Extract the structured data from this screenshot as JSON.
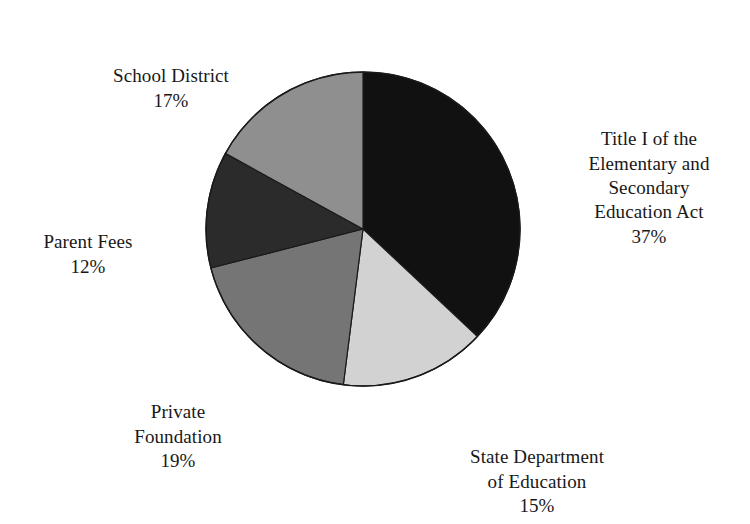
{
  "chart_data": {
    "type": "pie",
    "title": "",
    "subtitle": "",
    "xlabel": "",
    "ylabel": "",
    "legend_position": "none",
    "grid": false,
    "labels_show_percent": true,
    "start_angle_deg": 0,
    "direction": "clockwise",
    "categories": [
      "Title I of the Elementary and Secondary Education Act",
      "State Department of Education",
      "Private Foundation",
      "Parent Fees",
      "School District"
    ],
    "values": [
      37,
      15,
      19,
      12,
      17
    ],
    "units": "%",
    "slices": [
      {
        "name": "title-i",
        "label_lines": "Title I of the\nElementary and\nSecondary\nEducation Act",
        "percent_text": "37%",
        "value": 37,
        "color": "#111111"
      },
      {
        "name": "state-department-of-education",
        "label_lines": "State Department\nof Education",
        "percent_text": "15%",
        "value": 15,
        "color": "#d2d2d2"
      },
      {
        "name": "private-foundation",
        "label_lines": "Private\nFoundation",
        "percent_text": "19%",
        "value": 19,
        "color": "#757575"
      },
      {
        "name": "parent-fees",
        "label_lines": "Parent Fees",
        "percent_text": "12%",
        "value": 12,
        "color": "#2b2b2b"
      },
      {
        "name": "school-district",
        "label_lines": "School District",
        "percent_text": "17%",
        "value": 17,
        "color": "#8f8f8f"
      }
    ],
    "geometry": {
      "center_x": 363,
      "center_y": 229,
      "radius": 157
    },
    "colors": {
      "background": "#ffffff",
      "outline": "#1a1a1a",
      "text": "#181818"
    }
  }
}
